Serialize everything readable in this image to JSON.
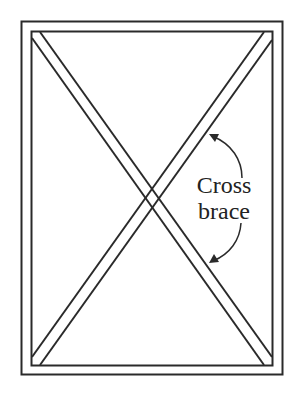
{
  "diagram": {
    "label": {
      "line1": "Cross",
      "line2": "brace"
    },
    "colors": {
      "stroke": "#2a2a2a",
      "background": "#ffffff",
      "text": "#222222"
    },
    "elements": [
      {
        "type": "outer-frame",
        "x": 21,
        "y": 21,
        "width": 262,
        "height": 354
      },
      {
        "type": "inner-frame",
        "x": 31,
        "y": 31,
        "width": 242,
        "height": 335
      },
      {
        "type": "diagonal-brace",
        "from": "top-left",
        "to": "bottom-right"
      },
      {
        "type": "diagonal-brace",
        "from": "top-right",
        "to": "bottom-left"
      },
      {
        "type": "arrow",
        "points_to": "top-right-to-bottom-left brace (upper)"
      },
      {
        "type": "arrow",
        "points_to": "top-right-to-bottom-left brace (lower)"
      }
    ]
  }
}
